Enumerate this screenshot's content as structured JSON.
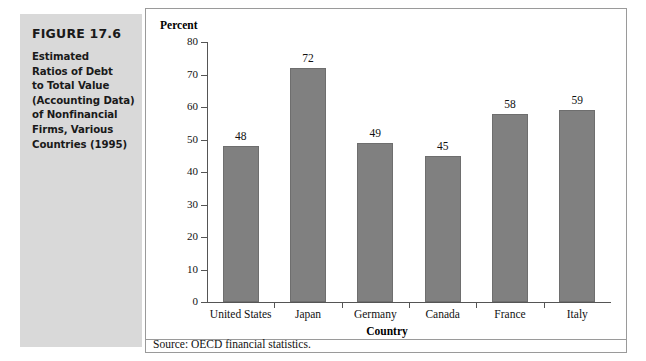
{
  "figure": {
    "number": "FIGURE 17.6",
    "caption_lines": [
      "Estimated",
      "Ratios of Debt",
      "to Total Value",
      "(Accounting Data)",
      "of Nonfinancial",
      "Firms, Various",
      "Countries (1995)"
    ]
  },
  "source_note": "Source: OECD financial statistics.",
  "colors": {
    "caption_block_background": "#d9d9d9",
    "bar_fill": "#808080",
    "bar_stroke": "#6e6e6e",
    "panel_border": "#9a9a9a",
    "axis": "#555555",
    "text": "#111111"
  },
  "chart_data": {
    "type": "bar",
    "title": "",
    "xlabel": "Country",
    "ylabel": "Percent",
    "categories": [
      "United States",
      "Japan",
      "Germany",
      "Canada",
      "France",
      "Italy"
    ],
    "values": [
      48,
      72,
      49,
      45,
      58,
      59
    ],
    "data_labels": [
      "48",
      "72",
      "49",
      "45",
      "58",
      "59"
    ],
    "ylim": [
      0,
      80
    ],
    "ytick_step": 10,
    "ytick_labels": [
      "0",
      "10",
      "20",
      "30",
      "40",
      "50",
      "60",
      "70",
      "80"
    ],
    "grid": false,
    "legend": false
  }
}
